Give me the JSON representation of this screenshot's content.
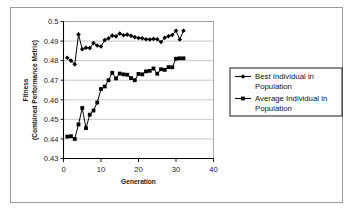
{
  "figure": {
    "background_color": "#ffffff",
    "frame_color": "#9b9b9b",
    "plot_border_color": "#000000",
    "gridline_color": "#b0b0b0"
  },
  "axes": {
    "x_title": "Generation",
    "y_title_line1": "Fitness",
    "y_title_line2": "(Combined Performance Metric)",
    "x_ticks": [
      "0",
      "10",
      "20",
      "30",
      "40"
    ],
    "y_ticks": [
      "0.43",
      "0.44",
      "0.45",
      "0.46",
      "0.47",
      "0.48",
      "0.49",
      "0.5"
    ]
  },
  "legend": {
    "border_color": "#000000",
    "entries": [
      {
        "label_line1": "Best Individual in",
        "label_line2": "Population",
        "marker": "diamond-marker",
        "color": "#000000"
      },
      {
        "label_line1": "Average Individual in",
        "label_line2": "Population",
        "marker": "square-marker",
        "color": "#000000"
      }
    ]
  },
  "chart_data": {
    "type": "line",
    "title": "",
    "xlabel": "Generation",
    "ylabel": "Fitness (Combined Performance Metric)",
    "xlim": [
      0,
      40
    ],
    "ylim": [
      0.43,
      0.5
    ],
    "xticks": [
      0,
      10,
      20,
      30,
      40
    ],
    "yticks": [
      0.43,
      0.44,
      0.45,
      0.46,
      0.47,
      0.48,
      0.49,
      0.5
    ],
    "grid": "horizontal",
    "legend_position": "right",
    "x": [
      1,
      2,
      3,
      4,
      5,
      6,
      7,
      8,
      9,
      10,
      11,
      12,
      13,
      14,
      15,
      16,
      17,
      18,
      19,
      20,
      21,
      22,
      23,
      24,
      25,
      26,
      27,
      28,
      29,
      30,
      31,
      32
    ],
    "series": [
      {
        "name": "Best Individual in Population",
        "marker": "diamond",
        "color": "#000000",
        "values": [
          0.4815,
          0.48,
          0.4781,
          0.4934,
          0.4858,
          0.4866,
          0.4864,
          0.489,
          0.4877,
          0.4872,
          0.4905,
          0.4914,
          0.4928,
          0.4924,
          0.4939,
          0.493,
          0.4933,
          0.4927,
          0.492,
          0.4916,
          0.4914,
          0.4909,
          0.4908,
          0.4911,
          0.4909,
          0.4895,
          0.4917,
          0.4925,
          0.4931,
          0.4953,
          0.4908,
          0.4953
        ]
      },
      {
        "name": "Average Individual in Population",
        "marker": "square",
        "color": "#000000",
        "values": [
          0.4412,
          0.4414,
          0.44,
          0.4474,
          0.4558,
          0.4455,
          0.4524,
          0.4545,
          0.4586,
          0.4655,
          0.4668,
          0.47,
          0.4738,
          0.4709,
          0.4734,
          0.473,
          0.4728,
          0.4711,
          0.47,
          0.4732,
          0.473,
          0.4745,
          0.4748,
          0.476,
          0.4733,
          0.4756,
          0.4753,
          0.4767,
          0.4766,
          0.481,
          0.4812,
          0.4812
        ]
      }
    ]
  }
}
